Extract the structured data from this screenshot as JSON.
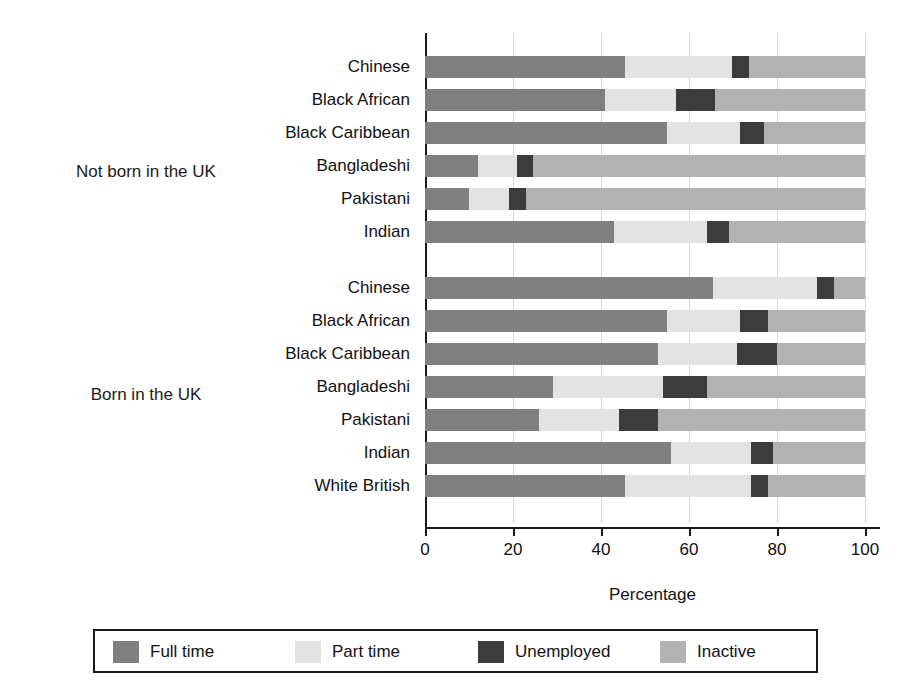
{
  "chart_data": {
    "type": "bar",
    "subtype": "horizontal-stacked",
    "title": "",
    "xlabel": "Percentage",
    "ylabel": "",
    "xlim": [
      0,
      105
    ],
    "xticks": [
      0,
      20,
      40,
      60,
      80,
      100
    ],
    "grid": "vertical",
    "legend_position": "bottom",
    "series": [
      {
        "name": "Full time",
        "color": "#808080"
      },
      {
        "name": "Part time",
        "color": "#e3e3e3"
      },
      {
        "name": "Unemployed",
        "color": "#3c3c3c"
      },
      {
        "name": "Inactive",
        "color": "#b2b2b2"
      }
    ],
    "groups": [
      {
        "label": "Not born in the UK",
        "rows": [
          {
            "category": "Chinese",
            "values": [
              45.5,
              24.3,
              3.8,
              26.4
            ]
          },
          {
            "category": "Black African",
            "values": [
              41.0,
              16.0,
              9.0,
              34.0
            ]
          },
          {
            "category": "Black Caribbean",
            "values": [
              55.0,
              16.5,
              5.5,
              23.0
            ]
          },
          {
            "category": "Bangladeshi",
            "values": [
              12.0,
              9.0,
              3.5,
              75.5
            ]
          },
          {
            "category": "Pakistani",
            "values": [
              10.0,
              9.0,
              4.0,
              77.0
            ]
          },
          {
            "category": "Indian",
            "values": [
              43.0,
              21.0,
              5.0,
              31.0
            ]
          }
        ]
      },
      {
        "label": "Born in the UK",
        "rows": [
          {
            "category": "Chinese",
            "values": [
              65.5,
              23.5,
              4.0,
              7.0
            ]
          },
          {
            "category": "Black African",
            "values": [
              55.0,
              16.5,
              6.5,
              22.0
            ]
          },
          {
            "category": "Black Caribbean",
            "values": [
              53.0,
              18.0,
              9.0,
              20.0
            ]
          },
          {
            "category": "Bangladeshi",
            "values": [
              29.0,
              25.0,
              10.0,
              36.0
            ]
          },
          {
            "category": "Pakistani",
            "values": [
              26.0,
              18.0,
              9.0,
              47.0
            ]
          },
          {
            "category": "Indian",
            "values": [
              56.0,
              18.0,
              5.0,
              21.0
            ]
          },
          {
            "category": "White British",
            "values": [
              45.5,
              28.5,
              4.0,
              22.0
            ]
          }
        ]
      }
    ]
  },
  "axis": {
    "x_title": "Percentage",
    "tick_labels": [
      "0",
      "20",
      "40",
      "60",
      "80",
      "100"
    ]
  },
  "legend": {
    "items": [
      {
        "label": "Full time",
        "color": "#808080"
      },
      {
        "label": "Part time",
        "color": "#e3e3e3"
      },
      {
        "label": "Unemployed",
        "color": "#3c3c3c"
      },
      {
        "label": "Inactive",
        "color": "#b2b2b2"
      }
    ]
  },
  "group_titles": [
    "Not born in the UK",
    "Born in the UK"
  ]
}
